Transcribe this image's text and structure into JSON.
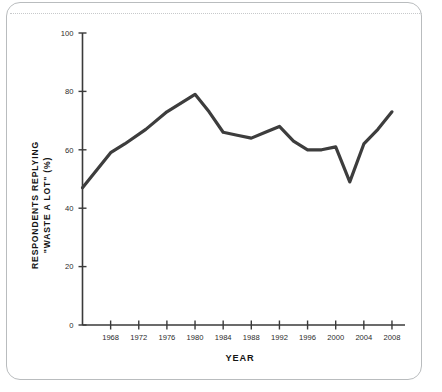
{
  "figure": {
    "card_border_color": "#b9bcbe",
    "background_color": "#ffffff",
    "rule_color": "#c7c9cb"
  },
  "chart_data": {
    "type": "line",
    "title": "",
    "xlabel": "YEAR",
    "ylabel_line1": "RESPONDENTS REPLYING",
    "ylabel_line2": "\"WASTE A LOT\" (%)",
    "ylabel": "RESPONDENTS REPLYING \"WASTE A LOT\" (%)",
    "xlim": [
      1964,
      2009
    ],
    "ylim": [
      0,
      100
    ],
    "grid": false,
    "legend": "none",
    "line_color": "#3d3d3d",
    "line_width": 3.2,
    "x_ticks": [
      1968,
      1972,
      1976,
      1980,
      1984,
      1988,
      1992,
      1996,
      2000,
      2004,
      2008
    ],
    "x_tick_labels": [
      "1968",
      "1972",
      "1976",
      "1980",
      "1984",
      "1988",
      "1992",
      "1996",
      "2000",
      "2004",
      "2008"
    ],
    "y_ticks": [
      0,
      20,
      40,
      60,
      80,
      100
    ],
    "y_tick_labels": [
      "0",
      "20",
      "40",
      "60",
      "80",
      "100"
    ],
    "x": [
      1964,
      1968,
      1970,
      1973,
      1976,
      1980,
      1982,
      1984,
      1986,
      1988,
      1990,
      1992,
      1994,
      1996,
      1998,
      2000,
      2002,
      2004,
      2006,
      2008
    ],
    "values": [
      47,
      59,
      62,
      67,
      73,
      79,
      73,
      66,
      65,
      64,
      66,
      68,
      63,
      60,
      60,
      61,
      49,
      62,
      67,
      73
    ],
    "series": [
      {
        "name": "Respondents replying \"waste a lot\"",
        "values": [
          47,
          59,
          62,
          67,
          73,
          79,
          73,
          66,
          65,
          64,
          66,
          68,
          63,
          60,
          60,
          61,
          49,
          62,
          67,
          73
        ]
      }
    ]
  }
}
